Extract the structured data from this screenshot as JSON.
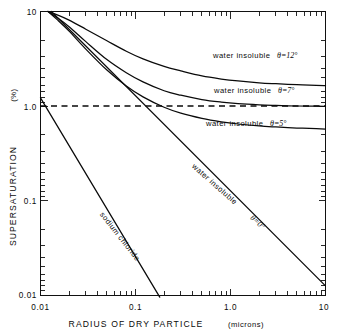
{
  "chart_data": {
    "type": "line",
    "title": "",
    "xlabel": "RADIUS OF DRY PARTICLE  (microns)",
    "xlabel_main": "RADIUS OF DRY PARTICLE",
    "xlabel_units": "(microns)",
    "ylabel": "SUPERSATURATION  (%)",
    "ylabel_main": "SUPERSATURATION",
    "ylabel_units": "(%)",
    "xscale": "log",
    "yscale": "log",
    "xlim": [
      0.01,
      10
    ],
    "ylim": [
      0.01,
      10
    ],
    "grid": false,
    "legend": "inline-annotations",
    "xticks": [
      "0.01",
      "0.1",
      "1.0",
      "10"
    ],
    "xtick_values": [
      0.01,
      0.1,
      1.0,
      10
    ],
    "yticks": [
      "0.01",
      "0.1",
      "1.0",
      "10"
    ],
    "ytick_values": [
      0.01,
      0.1,
      1.0,
      10
    ],
    "minor_ticks": true,
    "annotations": [
      {
        "text": "water insoluble",
        "theta": "θ=12°",
        "x": 2.0,
        "y": 0.33
      },
      {
        "text": "water insoluble",
        "theta": "θ=7°",
        "x": 2.0,
        "y": 0.155
      },
      {
        "text": "water insoluble",
        "theta": "θ=5°",
        "x": 2.0,
        "y": 0.082
      },
      {
        "text": "water insoluble",
        "theta": "θ=0°",
        "x": 0.9,
        "y": 0.16
      },
      {
        "text": "sodium chloride",
        "theta": "",
        "x": 0.06,
        "y": 0.1
      }
    ],
    "reference_line": {
      "label": "S = 1.0 %",
      "value": 1.0,
      "style": "dashed",
      "orientation": "horizontal"
    },
    "series": [
      {
        "name": "water insoluble θ=12°",
        "label": "water insoluble",
        "theta": "θ=12°",
        "style": "solid",
        "x": [
          0.012,
          0.015,
          0.02,
          0.03,
          0.05,
          0.08,
          0.12,
          0.2,
          0.3,
          0.5,
          0.8,
          1.2,
          2.0,
          3.0,
          5.0,
          8.0,
          10.0
        ],
        "y": [
          10.0,
          9.2,
          8.1,
          6.5,
          4.9,
          3.8,
          3.15,
          2.62,
          2.35,
          2.08,
          1.93,
          1.84,
          1.76,
          1.72,
          1.68,
          1.65,
          1.64
        ]
      },
      {
        "name": "water insoluble θ=7°",
        "label": "water insoluble",
        "theta": "θ=7°",
        "style": "solid",
        "x": [
          0.012,
          0.015,
          0.02,
          0.03,
          0.05,
          0.08,
          0.12,
          0.2,
          0.3,
          0.5,
          0.8,
          1.2,
          2.0,
          3.0,
          5.0,
          8.0,
          10.0
        ],
        "y": [
          10.0,
          8.6,
          6.9,
          4.8,
          3.1,
          2.25,
          1.8,
          1.45,
          1.3,
          1.17,
          1.1,
          1.06,
          1.03,
          1.015,
          1.0,
          0.995,
          0.99
        ]
      },
      {
        "name": "water insoluble θ=5°",
        "label": "water insoluble",
        "theta": "θ=5°",
        "style": "solid",
        "x": [
          0.012,
          0.015,
          0.02,
          0.03,
          0.05,
          0.08,
          0.12,
          0.2,
          0.3,
          0.5,
          0.8,
          1.2,
          2.0,
          3.0,
          5.0,
          8.0,
          10.0
        ],
        "y": [
          10.0,
          8.2,
          6.2,
          4.0,
          2.4,
          1.63,
          1.25,
          0.97,
          0.84,
          0.74,
          0.68,
          0.645,
          0.615,
          0.6,
          0.585,
          0.575,
          0.57
        ]
      },
      {
        "name": "water insoluble θ=0°",
        "label": "water insoluble",
        "theta": "θ=0°",
        "style": "solid-straight",
        "slope_note": "straight line on log-log, slope = -1",
        "x": [
          0.013,
          10.0
        ],
        "y": [
          10.0,
          0.0125
        ]
      },
      {
        "name": "sodium chloride",
        "label": "sodium chloride",
        "theta": "",
        "style": "solid-straight",
        "slope_note": "straight line on log-log, slope = -1.5",
        "x": [
          0.01,
          0.18
        ],
        "y": [
          1.22,
          0.0095
        ]
      }
    ]
  },
  "figure": {
    "background_color": "#ffffff",
    "ink_color": "#0a0a0a"
  }
}
